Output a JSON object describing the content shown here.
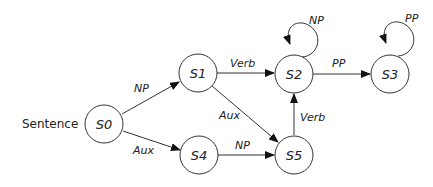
{
  "diagram": {
    "start_label": "Sentence",
    "nodes": [
      {
        "id": "S0",
        "label": "S0"
      },
      {
        "id": "S1",
        "label": "S1"
      },
      {
        "id": "S2",
        "label": "S2"
      },
      {
        "id": "S3",
        "label": "S3"
      },
      {
        "id": "S4",
        "label": "S4"
      },
      {
        "id": "S5",
        "label": "S5"
      }
    ],
    "edges": [
      {
        "from": "S0",
        "to": "S1",
        "label": "NP"
      },
      {
        "from": "S0",
        "to": "S4",
        "label": "Aux"
      },
      {
        "from": "S1",
        "to": "S2",
        "label": "Verb"
      },
      {
        "from": "S1",
        "to": "S5",
        "label": "Aux"
      },
      {
        "from": "S4",
        "to": "S5",
        "label": "NP"
      },
      {
        "from": "S5",
        "to": "S2",
        "label": "Verb"
      },
      {
        "from": "S2",
        "to": "S3",
        "label": "PP"
      },
      {
        "from": "S2",
        "to": "S2",
        "label": "NP"
      },
      {
        "from": "S3",
        "to": "S3",
        "label": "PP"
      }
    ]
  }
}
